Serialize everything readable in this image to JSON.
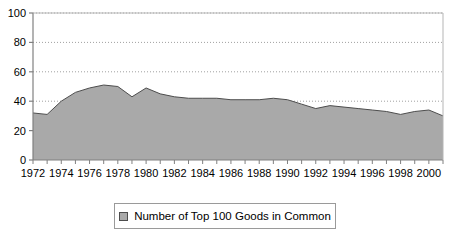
{
  "chart_data": {
    "type": "area",
    "title": "",
    "xlabel": "",
    "ylabel": "",
    "ylim": [
      0,
      100
    ],
    "xlim": [
      1972,
      2001
    ],
    "yticks": [
      0,
      20,
      40,
      60,
      80,
      100
    ],
    "ytick_labels": [
      "0",
      "20",
      "40",
      "60",
      "80",
      "100"
    ],
    "xticks": [
      1972,
      1974,
      1976,
      1978,
      1980,
      1982,
      1984,
      1986,
      1988,
      1990,
      1992,
      1994,
      1996,
      1998,
      2000
    ],
    "xtick_labels": [
      "1972",
      "1974",
      "1976",
      "1978",
      "1980",
      "1982",
      "1984",
      "1986",
      "1988",
      "1990",
      "1992",
      "1994",
      "1996",
      "1998",
      "2000"
    ],
    "minor_xticks_every": 1,
    "grid": "horizontal-dotted",
    "legend_position": "bottom-center",
    "series": [
      {
        "name": "Number of Top 100 Goods in Common",
        "fill_color": "#a9a9a9",
        "line_color": "#4d4d4d",
        "x": [
          1972,
          1973,
          1974,
          1975,
          1976,
          1977,
          1978,
          1979,
          1980,
          1981,
          1982,
          1983,
          1984,
          1985,
          1986,
          1987,
          1988,
          1989,
          1990,
          1991,
          1992,
          1993,
          1994,
          1995,
          1996,
          1997,
          1998,
          1999,
          2000,
          2001
        ],
        "values": [
          32,
          31,
          40,
          46,
          49,
          51,
          50,
          43,
          49,
          45,
          43,
          42,
          42,
          42,
          41,
          41,
          41,
          42,
          41,
          38,
          35,
          37,
          36,
          35,
          34,
          33,
          31,
          33,
          34,
          30
        ]
      }
    ]
  },
  "legend": {
    "swatch_name": "series-color-swatch",
    "label": "Number of Top 100 Goods in Common"
  },
  "colors": {
    "area_fill": "#a9a9a9",
    "area_line": "#4d4d4d",
    "axis": "#808080",
    "grid": "#a0a0a0",
    "text": "#000000",
    "legend_border": "#9a9a9a"
  }
}
